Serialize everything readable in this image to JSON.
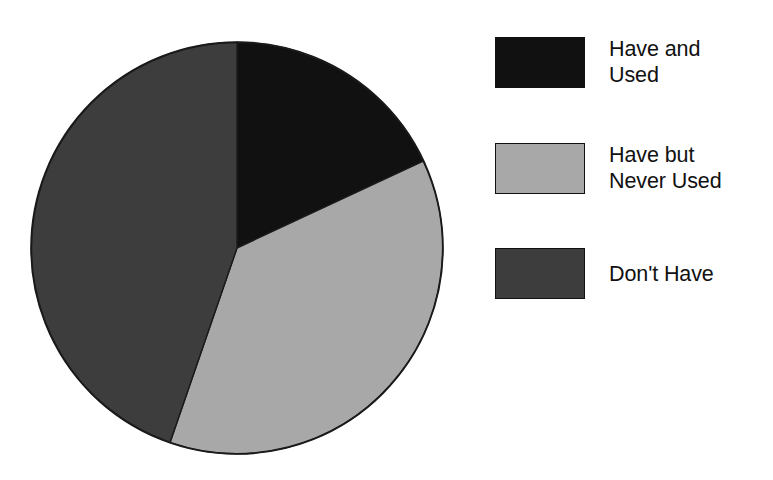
{
  "chart_data": {
    "type": "pie",
    "title": "",
    "subtitle": "",
    "xlabel": "",
    "ylabel": "",
    "legend_position": "right",
    "grid": false,
    "start_angle_deg": 0,
    "direction": "clockwise",
    "categories": [
      "Have and Used",
      "Have but Never Used",
      "Don't Have"
    ],
    "values": [
      18,
      37,
      45
    ],
    "units": "percent",
    "slices": [
      {
        "label": "Have and Used",
        "label_lines": "Have and\nUsed",
        "value": 18,
        "start_angle_deg": 0,
        "end_angle_deg": 65,
        "color": "#111111"
      },
      {
        "label": "Have but Never Used",
        "label_lines": "Have but\nNever Used",
        "value": 37,
        "start_angle_deg": 65,
        "end_angle_deg": 199,
        "color": "#a8a8a8"
      },
      {
        "label": "Don't Have",
        "label_lines": "Don't Have",
        "value": 45,
        "start_angle_deg": 199,
        "end_angle_deg": 360,
        "color": "#3d3d3d"
      }
    ]
  },
  "legend": {
    "items": [
      {
        "label": "Have and\nUsed",
        "color": "#111111"
      },
      {
        "label": "Have but\nNever Used",
        "color": "#a8a8a8"
      },
      {
        "label": "Don't Have",
        "color": "#3d3d3d"
      }
    ]
  },
  "style": {
    "background": "#ffffff",
    "outline": "#1a1a1a",
    "text": "#111111"
  }
}
